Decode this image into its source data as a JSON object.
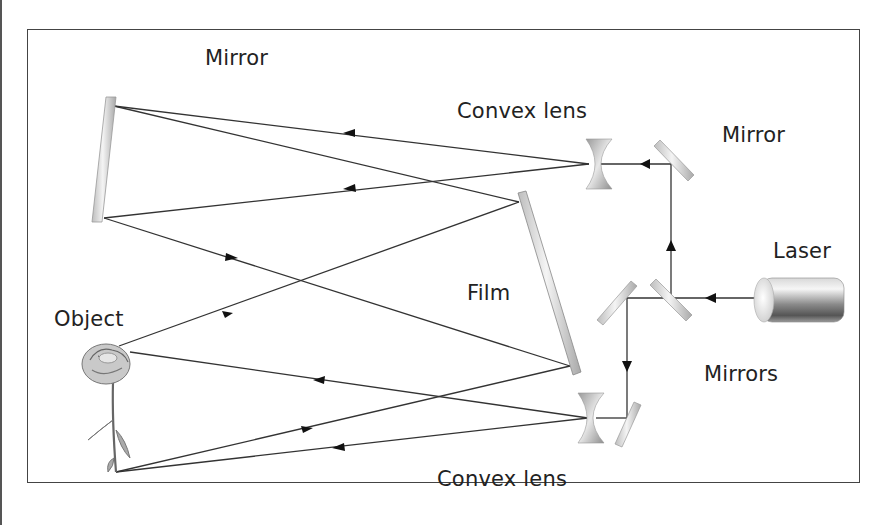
{
  "diagram": {
    "labels": {
      "mirror_top": "Mirror",
      "convex_lens_top": "Convex lens",
      "mirror_right": "Mirror",
      "laser": "Laser",
      "film": "Film",
      "object": "Object",
      "mirrors": "Mirrors",
      "convex_lens_bottom": "Convex lens"
    },
    "components": [
      {
        "name": "laser",
        "type": "cylinder"
      },
      {
        "name": "beam-splitter-mirror",
        "type": "mirror"
      },
      {
        "name": "upper-mirror",
        "type": "mirror"
      },
      {
        "name": "lower-left-mirror",
        "type": "mirror"
      },
      {
        "name": "lower-right-mirror",
        "type": "mirror"
      },
      {
        "name": "upper-lens",
        "type": "concave-lens-shape"
      },
      {
        "name": "lower-lens",
        "type": "concave-lens-shape"
      },
      {
        "name": "large-mirror",
        "type": "mirror"
      },
      {
        "name": "film",
        "type": "plate"
      },
      {
        "name": "object-rose",
        "type": "object"
      }
    ],
    "colors": {
      "line": "#333333",
      "frame": "#444444",
      "text": "#222222"
    }
  }
}
